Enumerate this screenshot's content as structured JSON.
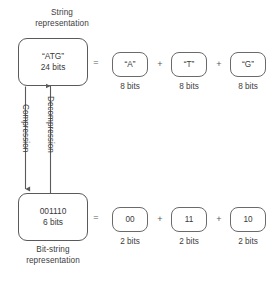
{
  "diagram": {
    "title_top": "String\nrepresentation",
    "title_bottom": "Bit-string\nrepresentation",
    "stroke_color": "#5a5a5a",
    "text_color": "#3a3a3a",
    "background": "#ffffff"
  },
  "string_row": {
    "box": {
      "value": "“ATG”",
      "size": "24 bits"
    },
    "equals": "=",
    "plus_1": "+",
    "plus_2": "+",
    "units": [
      {
        "value": "“A”",
        "size": "8 bits"
      },
      {
        "value": "“T”",
        "size": "8 bits"
      },
      {
        "value": "“G”",
        "size": "8 bits"
      }
    ]
  },
  "bitstring_row": {
    "box": {
      "value": "001110",
      "size": "6 bits"
    },
    "equals": "=",
    "plus_1": "+",
    "plus_2": "+",
    "units": [
      {
        "value": "00",
        "size": "2 bits"
      },
      {
        "value": "11",
        "size": "2 bits"
      },
      {
        "value": "10",
        "size": "2 bits"
      }
    ]
  },
  "arrows": {
    "compression_label": "Compression",
    "decompression_label": "Decompression"
  }
}
